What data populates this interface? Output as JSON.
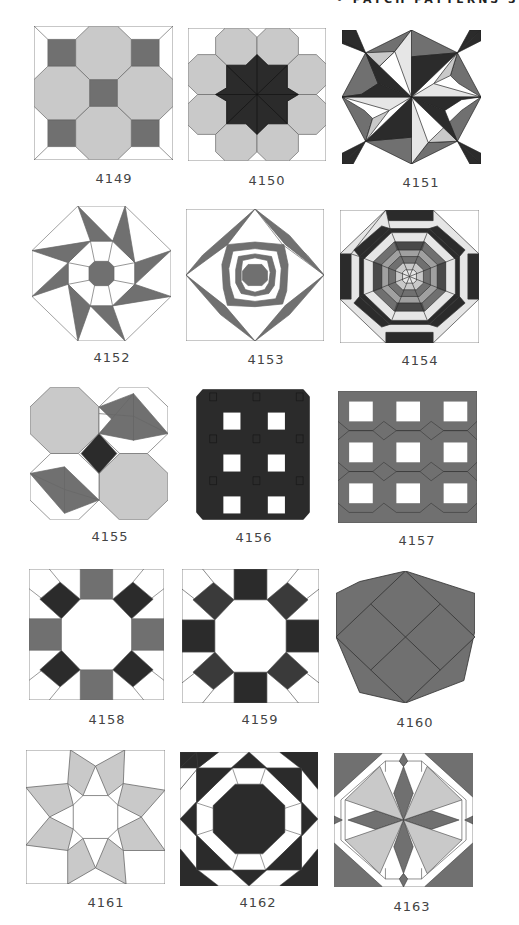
{
  "page": {
    "header": "• PATCH PATTERNS  3",
    "colors": {
      "white": "#ffffff",
      "light": "#c9c9c9",
      "pale": "#e6e6e6",
      "medium": "#707070",
      "dark": "#2b2b2b",
      "line": "#555555"
    }
  },
  "patterns": [
    {
      "id": "4149"
    },
    {
      "id": "4150"
    },
    {
      "id": "4151"
    },
    {
      "id": "4152"
    },
    {
      "id": "4153"
    },
    {
      "id": "4154"
    },
    {
      "id": "4155"
    },
    {
      "id": "4156"
    },
    {
      "id": "4157"
    },
    {
      "id": "4158"
    },
    {
      "id": "4159"
    },
    {
      "id": "4160"
    },
    {
      "id": "4161"
    },
    {
      "id": "4162"
    },
    {
      "id": "4163"
    }
  ]
}
